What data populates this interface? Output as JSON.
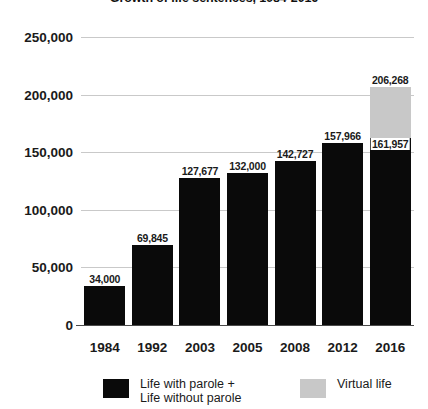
{
  "chart_data": {
    "type": "bar",
    "title": "Growth of life sentences, 1984-2016",
    "xlabel": "",
    "ylabel": "",
    "ylim": [
      0,
      250000
    ],
    "yticks": [
      "0",
      "50,000",
      "100,000",
      "150,000",
      "200,000",
      "250,000"
    ],
    "ytick_values": [
      0,
      50000,
      100000,
      150000,
      200000,
      250000
    ],
    "grid": true,
    "stacked": true,
    "legend_position": "bottom",
    "categories": [
      "1984",
      "1992",
      "2003",
      "2005",
      "2008",
      "2012",
      "2016"
    ],
    "series": [
      {
        "name": "Life with parole +\nLife without parole",
        "color": "#0a0a0a",
        "values": [
          34000,
          69845,
          127677,
          132000,
          142727,
          157966,
          161957
        ]
      },
      {
        "name": "Virtual life",
        "color": "#c8c8c8",
        "values": [
          0,
          0,
          0,
          0,
          0,
          0,
          44311
        ]
      }
    ],
    "bar_labels": [
      {
        "year": "1984",
        "label": "34,000",
        "position": "outside"
      },
      {
        "year": "1992",
        "label": "69,845",
        "position": "outside"
      },
      {
        "year": "2003",
        "label": "127,677",
        "position": "outside"
      },
      {
        "year": "2005",
        "label": "132,000",
        "position": "outside"
      },
      {
        "year": "2008",
        "label": "142,727",
        "position": "outside"
      },
      {
        "year": "2012",
        "label": "157,966",
        "position": "outside"
      },
      {
        "year": "2016",
        "label": "206,268",
        "position": "outside-total"
      },
      {
        "year": "2016",
        "label": "161,957",
        "position": "inside-black-top"
      }
    ],
    "totals": [
      34000,
      69845,
      127677,
      132000,
      142727,
      157966,
      206268
    ]
  },
  "legend": {
    "entries": [
      {
        "label": "Life with parole +\nLife without parole",
        "color": "#0a0a0a"
      },
      {
        "label": "Virtual life",
        "color": "#c8c8c8"
      }
    ]
  },
  "colors": {
    "bar_black": "#0a0a0a",
    "bar_gray": "#c8c8c8",
    "gridline": "#c9c9c9",
    "axis": "#4a4a4a",
    "text": "#1a1a1a",
    "background": "#ffffff"
  }
}
